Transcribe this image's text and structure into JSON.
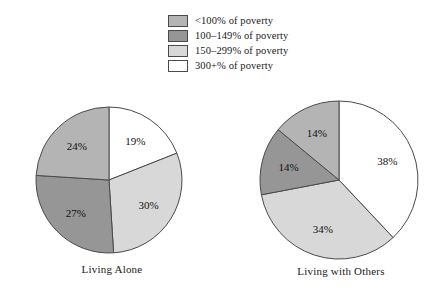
{
  "legend": {
    "items": [
      {
        "label": "<100% of poverty",
        "color": "#b4b4b4"
      },
      {
        "label": "100–149% of poverty",
        "color": "#969696"
      },
      {
        "label": "150–299% of poverty",
        "color": "#d8d8d8"
      },
      {
        "label": "300+% of poverty",
        "color": "#ffffff"
      }
    ]
  },
  "chart_data": [
    {
      "type": "pie",
      "title": "Living Alone",
      "categories": [
        "<100% of poverty",
        "100–149% of poverty",
        "150–299% of poverty",
        "300+% of poverty"
      ],
      "values": [
        24,
        27,
        30,
        19
      ],
      "labels": [
        "24%",
        "27%",
        "30%",
        "19%"
      ],
      "colors": [
        "#b4b4b4",
        "#969696",
        "#d8d8d8",
        "#ffffff"
      ],
      "start_angle_deg": 0,
      "direction": "clockwise",
      "draw_order": [
        "300+% of poverty",
        "150–299% of poverty",
        "100–149% of poverty",
        "<100% of poverty"
      ],
      "legend_position": "top-center"
    },
    {
      "type": "pie",
      "title": "Living with Others",
      "categories": [
        "<100% of poverty",
        "100–149% of poverty",
        "150–299% of poverty",
        "300+% of poverty"
      ],
      "values": [
        14,
        14,
        34,
        38
      ],
      "labels": [
        "14%",
        "14%",
        "34%",
        "38%"
      ],
      "colors": [
        "#b4b4b4",
        "#969696",
        "#d8d8d8",
        "#ffffff"
      ],
      "start_angle_deg": 0,
      "direction": "clockwise",
      "draw_order": [
        "300+% of poverty",
        "150–299% of poverty",
        "100–149% of poverty",
        "<100% of poverty"
      ],
      "legend_position": "top-center"
    }
  ],
  "pies": {
    "left": {
      "caption": "Living Alone",
      "slices": [
        {
          "label": "19%",
          "value": 19,
          "color": "#ffffff",
          "category": "300+% of poverty"
        },
        {
          "label": "30%",
          "value": 30,
          "color": "#d8d8d8",
          "category": "150–299% of poverty"
        },
        {
          "label": "27%",
          "value": 27,
          "color": "#969696",
          "category": "100–149% of poverty"
        },
        {
          "label": "24%",
          "value": 24,
          "color": "#b4b4b4",
          "category": "<100% of poverty"
        }
      ]
    },
    "right": {
      "caption": "Living with Others",
      "slices": [
        {
          "label": "38%",
          "value": 38,
          "color": "#ffffff",
          "category": "300+% of poverty"
        },
        {
          "label": "34%",
          "value": 34,
          "color": "#d8d8d8",
          "category": "150–299% of poverty"
        },
        {
          "label": "14%",
          "value": 14,
          "color": "#969696",
          "category": "100–149% of poverty"
        },
        {
          "label": "14%",
          "value": 14,
          "color": "#b4b4b4",
          "category": "<100% of poverty"
        }
      ]
    }
  },
  "style": {
    "stroke": "#4a4a4a",
    "background": "#ffffff",
    "text_color": "#111111"
  }
}
